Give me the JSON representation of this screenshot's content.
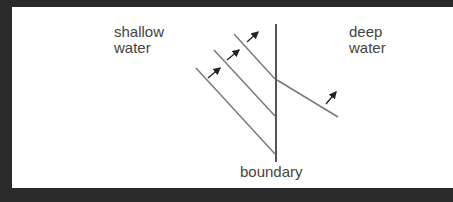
{
  "labels": {
    "shallow": [
      "shallow",
      "water"
    ],
    "deep": [
      "deep",
      "water"
    ],
    "boundary": "boundary"
  },
  "colors": {
    "line": "#7a7a7a",
    "boundary": "#555555",
    "arrow": "#222222",
    "frame": "#2a2a2a"
  }
}
